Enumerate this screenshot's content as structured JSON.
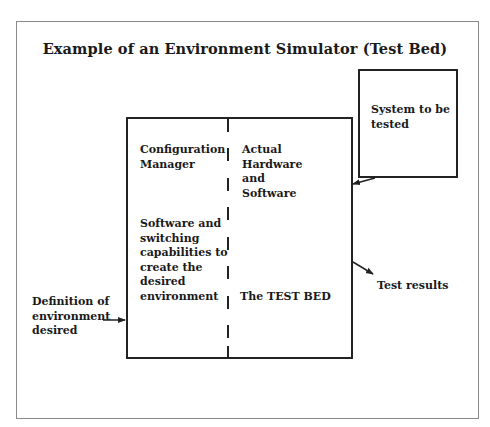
{
  "diagram": {
    "title": "Example of an Environment Simulator (Test Bed)",
    "nodes": {
      "config_manager": "Configuration\nManager",
      "actual_hw_sw": "Actual\nHardware\nand\nSoftware",
      "switching": "Software and\nswitching\ncapabilities to\ncreate the\ndesired\nenvironment",
      "test_bed": "The TEST BED",
      "system_tested": "System to be\ntested",
      "definition": "Definition of\nenvironment\ndesired",
      "test_results": "Test results"
    },
    "edges": [
      {
        "from": "definition",
        "to": "test_bed_box"
      },
      {
        "from": "system_tested",
        "to": "test_bed_box"
      },
      {
        "from": "test_bed_box",
        "to": "test_results"
      }
    ],
    "colors": {
      "line": "#222222",
      "frame": "#8a8a8a",
      "background": "#ffffff"
    }
  }
}
